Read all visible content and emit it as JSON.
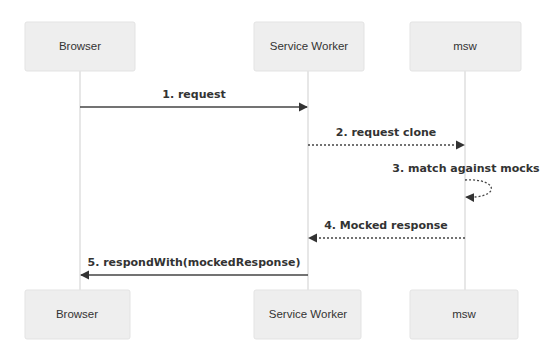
{
  "diagram": {
    "type": "sequence",
    "participants": [
      {
        "id": "browser",
        "label": "Browser"
      },
      {
        "id": "sw",
        "label": "Service Worker"
      },
      {
        "id": "msw",
        "label": "msw"
      }
    ],
    "messages": [
      {
        "n": 1,
        "from": "browser",
        "to": "sw",
        "style": "solid",
        "label": "1. request"
      },
      {
        "n": 2,
        "from": "sw",
        "to": "msw",
        "style": "dotted",
        "label": "2. request clone"
      },
      {
        "n": 3,
        "from": "msw",
        "to": "msw",
        "style": "dotted",
        "label": "3. match against mocks"
      },
      {
        "n": 4,
        "from": "msw",
        "to": "sw",
        "style": "dotted",
        "label": "4. Mocked response"
      },
      {
        "n": 5,
        "from": "sw",
        "to": "browser",
        "style": "solid",
        "label": "5. respondWith(mockedResponse)"
      }
    ],
    "colors": {
      "actor_fill": "#eeeeee",
      "actor_stroke": "#e3e3e3",
      "lifeline": "#cfcfcf",
      "arrow": "#444444",
      "text": "#333333"
    }
  }
}
